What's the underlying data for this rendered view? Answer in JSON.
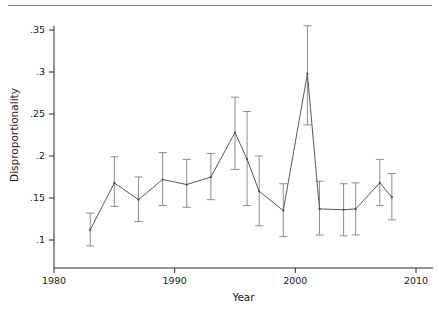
{
  "chart_data": {
    "type": "line",
    "title": "",
    "subtitle": "",
    "xlabel": "Year",
    "ylabel": "Disproportionality",
    "xlim": [
      1980,
      2010
    ],
    "ylim": [
      0.1,
      0.355
    ],
    "grid": false,
    "legend": null,
    "error_bars": "vertical capped 95% confidence intervals",
    "xticks": [
      1980,
      1990,
      2000,
      2010
    ],
    "xtick_labels": [
      "1980",
      "1990",
      "2000",
      "2010"
    ],
    "yticks": [
      0.1,
      0.15,
      0.2,
      0.25,
      0.3,
      0.35
    ],
    "ytick_labels": [
      ".1",
      ".15",
      ".2",
      ".25",
      ".3",
      ".35"
    ],
    "x": [
      1983,
      1985,
      1987,
      1989,
      1991,
      1993,
      1995,
      1996,
      1997,
      1999,
      2001,
      2002,
      2004,
      2005,
      2007,
      2008
    ],
    "values": [
      0.112,
      0.168,
      0.148,
      0.172,
      0.166,
      0.175,
      0.228,
      0.196,
      0.158,
      0.135,
      0.298,
      0.137,
      0.136,
      0.137,
      0.168,
      0.151
    ],
    "err_low": [
      0.093,
      0.14,
      0.122,
      0.141,
      0.139,
      0.148,
      0.184,
      0.141,
      0.117,
      0.104,
      0.237,
      0.106,
      0.105,
      0.106,
      0.141,
      0.124
    ],
    "err_high": [
      0.132,
      0.199,
      0.175,
      0.204,
      0.196,
      0.203,
      0.27,
      0.253,
      0.2,
      0.167,
      0.355,
      0.17,
      0.167,
      0.168,
      0.196,
      0.179
    ],
    "series": [
      {
        "name": "Disproportionality",
        "values": [
          0.112,
          0.168,
          0.148,
          0.172,
          0.166,
          0.175,
          0.228,
          0.196,
          0.158,
          0.135,
          0.298,
          0.137,
          0.136,
          0.137,
          0.168,
          0.151
        ]
      }
    ]
  }
}
